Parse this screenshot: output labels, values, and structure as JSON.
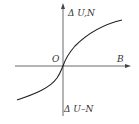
{
  "diagram": {
    "y_axis_label_top": "Δ U,N",
    "y_axis_label_bottom": "Δ U–N",
    "origin_label": "O",
    "x_axis_label": "B",
    "curve": "S-shaped curve passing through origin, rising from lower-left to upper-right",
    "colors": {
      "line": "#333333",
      "background": "#ffffff"
    }
  }
}
